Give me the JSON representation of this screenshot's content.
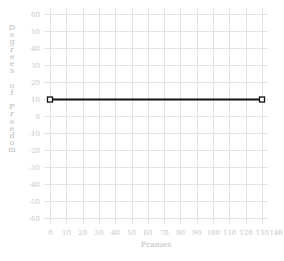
{
  "chart_data": {
    "type": "line",
    "title": "",
    "xlabel": "Frames",
    "ylabel": "Degrees of Freedom",
    "xlim": [
      0,
      130
    ],
    "ylim": [
      -60,
      60
    ],
    "x_ticks": [
      0,
      10,
      20,
      30,
      40,
      50,
      60,
      70,
      80,
      90,
      100,
      110,
      120,
      130,
      140,
      150
    ],
    "y_ticks": [
      60,
      50,
      40,
      30,
      20,
      10,
      0,
      -10,
      -20,
      -30,
      -40,
      -50,
      -60
    ],
    "grid": true,
    "legend": null,
    "series": [
      {
        "name": "value",
        "color": "#111111",
        "marker": "square-open",
        "points": [
          {
            "x": 0,
            "y": 10
          },
          {
            "x": 130,
            "y": 10
          }
        ]
      }
    ]
  },
  "labels": {
    "xlabel": "Frames",
    "ylabel_letters": [
      "D",
      "e",
      "g",
      "r",
      "e",
      "e",
      "s",
      " ",
      "o",
      "f",
      " ",
      "F",
      "r",
      "e",
      "e",
      "d",
      "o",
      "m"
    ]
  },
  "colors": {
    "line": "#111111",
    "grid": "#e3e3e3",
    "text": "#c8c8c8"
  }
}
